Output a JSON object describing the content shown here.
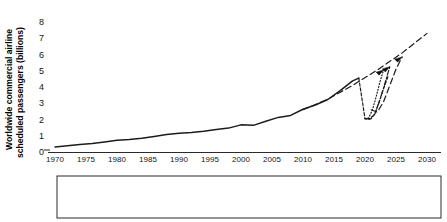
{
  "chart_data": {
    "type": "line",
    "title": "",
    "subtitle": "",
    "xlabel": "",
    "ylabel": "Worldwide commercial airline scheduled passengers (billions)",
    "ylabel_line1": "Worldwide commercial airline",
    "ylabel_line2": "scheduled passengers (billions)",
    "xlim": [
      1970,
      2030
    ],
    "ylim": [
      0,
      8
    ],
    "grid": false,
    "legend_position": "bottom",
    "x_ticks": [
      1970,
      1975,
      1980,
      1985,
      1990,
      1995,
      2000,
      2005,
      2010,
      2015,
      2020,
      2025,
      2030
    ],
    "x_tick_labels": [
      "1970",
      "1975",
      "1980",
      "1985",
      "1990",
      "1995",
      "2000",
      "2005",
      "2010",
      "2015",
      "2020",
      "2025",
      "2030"
    ],
    "y_ticks": [
      0,
      1,
      2,
      3,
      4,
      5,
      6,
      7,
      8
    ],
    "y_tick_labels": [
      "0",
      "1",
      "2",
      "3",
      "4",
      "5",
      "6",
      "7",
      "8"
    ],
    "series": [
      {
        "name": "Actual traffic",
        "style": "solid",
        "color": "#1c1c1c",
        "x": [
          1970,
          1972,
          1974,
          1976,
          1978,
          1980,
          1982,
          1984,
          1986,
          1988,
          1990,
          1992,
          1994,
          1996,
          1998,
          2000,
          2002,
          2004,
          2006,
          2008,
          2010,
          2012,
          2014,
          2016,
          2018,
          2019
        ],
        "values": [
          0.31,
          0.38,
          0.46,
          0.52,
          0.62,
          0.72,
          0.77,
          0.85,
          0.96,
          1.08,
          1.16,
          1.2,
          1.28,
          1.39,
          1.47,
          1.67,
          1.64,
          1.89,
          2.13,
          2.25,
          2.63,
          2.89,
          3.23,
          3.78,
          4.38,
          4.55
        ]
      },
      {
        "name": "Forecasted 2020 traffic",
        "style": "dashed",
        "color": "#1c1c1c",
        "x": [
          2019,
          2020,
          2020.5,
          2021,
          2021.6,
          2022.2,
          2023,
          2023.8
        ],
        "values": [
          4.55,
          2.05,
          2.0,
          2.05,
          2.35,
          3.0,
          3.9,
          4.75
        ]
      },
      {
        "name": "Exponential growth trend",
        "style": "longdash",
        "color": "#1c1c1c",
        "x": [
          2010,
          2014,
          2018,
          2022,
          2026,
          2030
        ],
        "values": [
          2.6,
          3.25,
          4.1,
          5.05,
          6.1,
          7.3
        ]
      },
      {
        "name": "Scenario 1A",
        "style": "dotted",
        "color": "#1c1c1c",
        "x": [
          2020,
          2020.6,
          2021.2,
          2021.8,
          2022.4,
          2023
        ],
        "values": [
          2.05,
          2.1,
          2.6,
          3.4,
          4.3,
          5.05
        ]
      },
      {
        "name": "Scenario 1B",
        "style": "dashdot",
        "color": "#1c1c1c",
        "x": [
          2020,
          2020.8,
          2021.6,
          2022.4,
          2023.2,
          2024
        ],
        "values": [
          2.05,
          2.05,
          2.35,
          3.2,
          4.2,
          5.25
        ]
      },
      {
        "name": "Scenario 1C",
        "style": "longdash",
        "color": "#1c1c1c",
        "x": [
          2021,
          2022,
          2023,
          2024,
          2025,
          2026
        ],
        "values": [
          2.6,
          2.45,
          3.1,
          4.1,
          5.1,
          5.85
        ]
      }
    ],
    "annotations": [
      {
        "name": "arrowhead-scenario-1a",
        "x": 2023,
        "y": 5.05
      },
      {
        "name": "arrowhead-scenario-1b",
        "x": 2024,
        "y": 5.25
      },
      {
        "name": "arrowhead-scenario-1c",
        "x": 2026,
        "y": 5.85
      }
    ]
  },
  "legend": {
    "entries": [
      {
        "label": "Actual traffic",
        "style": "solid"
      },
      {
        "label": "Forecasted 2020 traffic",
        "style": "dashed"
      },
      {
        "label": "Exponential growth trend",
        "style": "longdash"
      },
      {
        "label": "Scenario 1A",
        "style": "dotted"
      },
      {
        "label": "Scenario 1B",
        "style": "dashdot"
      },
      {
        "label": "Scenario 1C",
        "style": "longdash-wide"
      }
    ]
  }
}
